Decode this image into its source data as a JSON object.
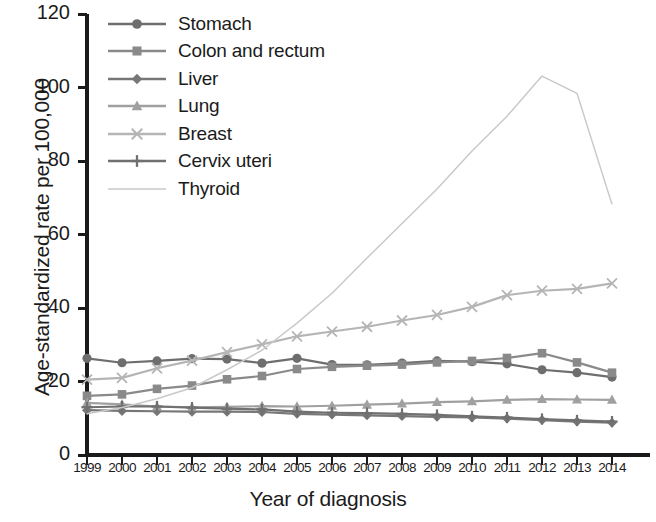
{
  "chart_data": {
    "type": "line",
    "title": "",
    "xlabel": "Year of diagnosis",
    "ylabel": "Age-standardized rate per 100,000",
    "categories": [
      1999,
      2000,
      2001,
      2002,
      2003,
      2004,
      2005,
      2006,
      2007,
      2008,
      2009,
      2010,
      2011,
      2012,
      2013,
      2014
    ],
    "xlim": [
      1999,
      2014
    ],
    "ylim": [
      0,
      120
    ],
    "yticks": [
      0,
      20,
      40,
      60,
      80,
      100,
      120
    ],
    "grid": false,
    "legend_position": "top-left",
    "series": [
      {
        "name": "Stomach",
        "marker": "circle",
        "color": "#6e6e6e",
        "values": [
          26.3,
          25.1,
          25.6,
          26.2,
          26.1,
          25.0,
          26.3,
          24.6,
          24.5,
          25.0,
          25.6,
          25.4,
          24.8,
          23.2,
          22.4,
          21.2
        ]
      },
      {
        "name": "Colon and rectum",
        "marker": "square",
        "color": "#8a8a8a",
        "values": [
          16.1,
          16.5,
          18.0,
          18.9,
          20.6,
          21.5,
          23.4,
          24.0,
          24.3,
          24.6,
          25.2,
          25.6,
          26.4,
          27.7,
          25.2,
          22.4
        ]
      },
      {
        "name": "Liver",
        "marker": "diamond",
        "color": "#777777",
        "values": [
          12.2,
          12.0,
          11.9,
          11.8,
          11.8,
          11.7,
          11.2,
          11.0,
          10.8,
          10.6,
          10.4,
          10.2,
          9.9,
          9.5,
          9.1,
          8.8
        ]
      },
      {
        "name": "Lung",
        "marker": "triangle",
        "color": "#a0a0a0",
        "values": [
          14.2,
          13.8,
          13.2,
          13.0,
          13.1,
          13.3,
          13.2,
          13.4,
          13.7,
          14.0,
          14.4,
          14.6,
          15.0,
          15.2,
          15.1,
          15.0
        ]
      },
      {
        "name": "Breast",
        "marker": "cross",
        "color": "#b5b5b5",
        "values": [
          20.5,
          21.0,
          23.6,
          25.7,
          28.0,
          30.1,
          32.3,
          33.6,
          34.9,
          36.6,
          38.1,
          40.3,
          43.5,
          44.7,
          45.2,
          46.7
        ]
      },
      {
        "name": "Cervix uteri",
        "marker": "plus",
        "color": "#707070",
        "values": [
          13.0,
          13.2,
          13.2,
          12.9,
          12.6,
          12.4,
          11.8,
          11.5,
          11.4,
          11.2,
          10.9,
          10.5,
          10.2,
          9.8,
          9.4,
          9.1
        ]
      },
      {
        "name": "Thyroid",
        "marker": "none",
        "color": "#c9c9c9",
        "values": [
          11.2,
          12.9,
          15.3,
          18.3,
          23.2,
          28.5,
          35.9,
          44.0,
          53.6,
          63.0,
          72.4,
          82.7,
          92.2,
          103.1,
          98.4,
          68.2
        ]
      }
    ]
  },
  "axis": {
    "yticks": [
      "0",
      "20",
      "40",
      "60",
      "80",
      "100",
      "120"
    ],
    "xticks": [
      "1999",
      "2000",
      "2001",
      "2002",
      "2003",
      "2004",
      "2005",
      "2006",
      "2007",
      "2008",
      "2009",
      "2010",
      "2011",
      "2012",
      "2013",
      "2014"
    ]
  },
  "colors": {
    "axis": "#1b1b1b",
    "text": "#1b1b1b",
    "background": "#ffffff"
  }
}
